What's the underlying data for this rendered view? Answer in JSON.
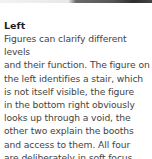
{
  "caption": {
    "title": "Left",
    "lines": [
      "Figures can clarify different levels",
      "and their function. The figure on",
      "the left identifies a stair, which",
      "is not itself visible, the figure",
      "in the bottom right obviously",
      "looks up through a void, the",
      "other two explain the booths",
      "and access to them. All four",
      "are deliberately in soft focus."
    ]
  },
  "colors": {
    "title": "#1f1f1f",
    "body": "#444444",
    "background": "#ffffff"
  }
}
